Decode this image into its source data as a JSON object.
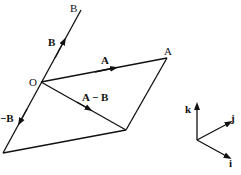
{
  "diagram": {
    "labels": {
      "B_end": "B",
      "B_vec": "B",
      "O": "O",
      "A_end": "A",
      "A_vec": "A",
      "A_minus_B": "A − B",
      "neg_B": "−B",
      "k": "k",
      "j": "j",
      "i": "i"
    },
    "colors": {
      "line": "#111111",
      "background": "#ffffff"
    }
  }
}
